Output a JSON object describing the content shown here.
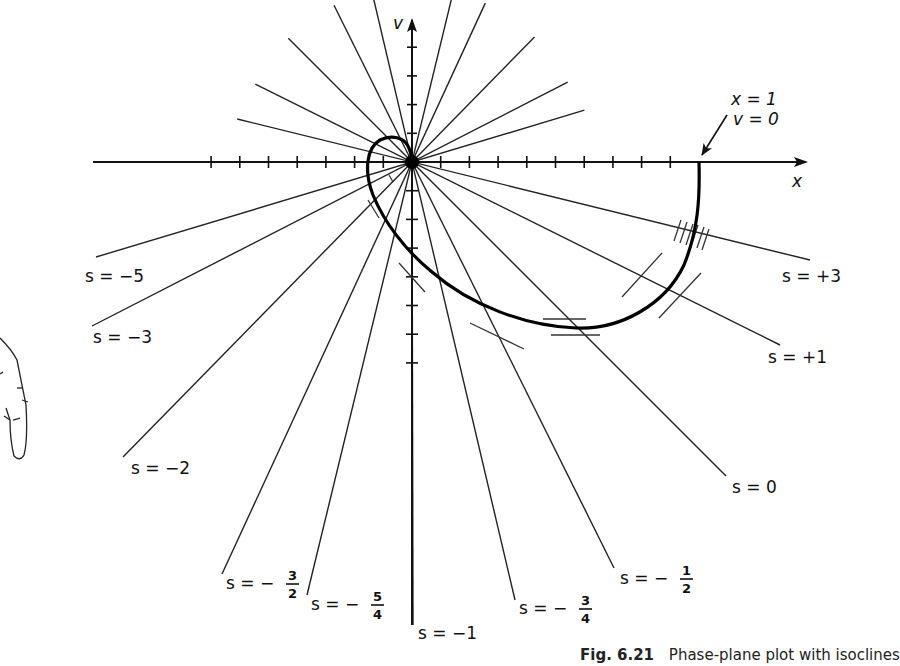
{
  "figure": {
    "axes": {
      "x_label": "x",
      "y_label": "v",
      "origin_px": [
        412,
        162
      ],
      "tick_spacing_px": 28.7,
      "tick_unit": 0.1
    },
    "annotation": {
      "line1": "x = 1",
      "line2": "v = 0"
    },
    "isoclines": [
      {
        "id": "s_plus_3",
        "label": "s = +3",
        "end": [
          810,
          260
        ],
        "label_pos": [
          782,
          282
        ]
      },
      {
        "id": "s_plus_1",
        "label": "s = +1",
        "end": [
          780,
          345
        ],
        "label_pos": [
          768,
          363
        ]
      },
      {
        "id": "s_0",
        "label": "s = 0",
        "end": [
          726,
          476
        ],
        "label_pos": [
          732,
          493
        ]
      },
      {
        "id": "s_minus_1_2",
        "label_prefix": "s = −",
        "num": "1",
        "den": "2",
        "end": [
          614,
          568
        ],
        "label_pos": [
          620,
          584
        ]
      },
      {
        "id": "s_minus_3_4",
        "label_prefix": "s = −",
        "num": "3",
        "den": "4",
        "end": [
          515,
          600
        ],
        "label_pos": [
          519,
          614
        ]
      },
      {
        "id": "s_minus_1",
        "label": "s = −1",
        "end": [
          413,
          625
        ],
        "label_pos": [
          418,
          639
        ]
      },
      {
        "id": "s_minus_5_4",
        "label_prefix": "s = −",
        "num": "5",
        "den": "4",
        "end": [
          307,
          595
        ],
        "label_pos": [
          311,
          610
        ]
      },
      {
        "id": "s_minus_3_2",
        "label_prefix": "s = −",
        "num": "3",
        "den": "2",
        "end": [
          222,
          574
        ],
        "label_pos": [
          226,
          589
        ]
      },
      {
        "id": "s_minus_2",
        "label": "s = −2",
        "end": [
          123,
          457
        ],
        "label_pos": [
          131,
          474
        ]
      },
      {
        "id": "s_minus_3",
        "label": "s = −3",
        "end": [
          92,
          326
        ],
        "label_pos": [
          93,
          343
        ]
      },
      {
        "id": "s_minus_5",
        "label": "s = −5",
        "end": [
          96,
          257
        ],
        "label_pos": [
          85,
          282
        ]
      }
    ],
    "trajectory": {
      "description": "Phase trajectory starting at x=1, v=0 spiraling into origin",
      "start": [
        699,
        162
      ]
    }
  },
  "caption": {
    "fig_number": "Fig. 6.21",
    "text": "Phase-plane plot with isoclines"
  }
}
